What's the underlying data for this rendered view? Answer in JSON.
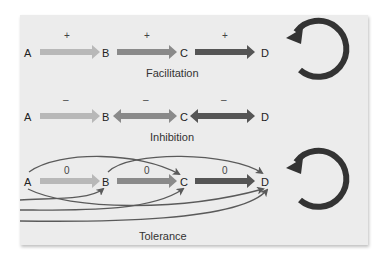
{
  "figure": {
    "colors": {
      "panel_bg": "#ececec",
      "arrow_light": "#b8b8b8",
      "arrow_medium": "#8a8a8a",
      "arrow_dark": "#555555",
      "cycle_arrow": "#333333",
      "curve": "#5a5a5a"
    },
    "panels": [
      {
        "caption": "Facilitation",
        "nodes": [
          "A",
          "B",
          "C",
          "D"
        ],
        "effects": [
          "+",
          "+",
          "+"
        ],
        "arrow_heads": [
          "right",
          "right",
          "right"
        ],
        "cycle_icon": "circular-arrow-icon"
      },
      {
        "caption": "Inhibition",
        "nodes": [
          "A",
          "B",
          "C",
          "D"
        ],
        "effects": [
          "–",
          "–",
          "–"
        ],
        "arrow_heads": [
          "right",
          "both",
          "both"
        ]
      },
      {
        "caption": "Tolerance",
        "nodes": [
          "A",
          "B",
          "C",
          "D"
        ],
        "effects": [
          "0",
          "0",
          "0"
        ],
        "arrow_heads": [
          "right",
          "right",
          "right"
        ],
        "cross_links": [
          "A→C",
          "B→D",
          "A→D",
          "prior→B",
          "prior→C",
          "prior→D"
        ],
        "cycle_icon": "circular-arrow-icon"
      }
    ]
  }
}
